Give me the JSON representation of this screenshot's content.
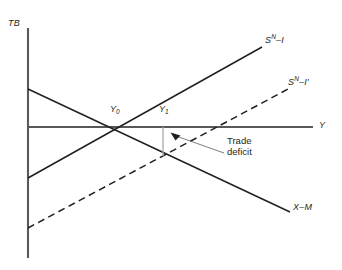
{
  "figure": {
    "type": "economics-line-diagram"
  },
  "axes": {
    "y_axis_label": "TB",
    "x_axis_label": "Y",
    "origin_px": {
      "x": 28,
      "y": 127
    },
    "x_axis_end_px": {
      "x": 313,
      "y": 127
    },
    "y_axis_top_px": {
      "x": 28,
      "y": 28
    },
    "y_axis_bottom_px": {
      "x": 28,
      "y": 258
    }
  },
  "curves": [
    {
      "name": "sn-minus-i",
      "label_base": "S",
      "label_sup": "N",
      "label_rest": "–I",
      "label_text": "Sᴺ–I",
      "style": "solid",
      "color": "#231f20",
      "start_px": {
        "x": 28,
        "y": 178
      },
      "end_px": {
        "x": 262,
        "y": 47
      },
      "label_px": {
        "x": 265,
        "y": 38
      }
    },
    {
      "name": "sn-minus-i-prime",
      "label_base": "S",
      "label_sup": "N",
      "label_rest": "–I′",
      "label_text": "Sᴺ–I′",
      "style": "dashed",
      "color": "#231f20",
      "start_px": {
        "x": 28,
        "y": 228
      },
      "end_px": {
        "x": 290,
        "y": 88
      },
      "label_px": {
        "x": 292,
        "y": 79
      }
    },
    {
      "name": "x-minus-m",
      "label_base": "X",
      "label_sup": "",
      "label_rest": "–M",
      "label_text": "X–M",
      "style": "solid",
      "color": "#231f20",
      "start_px": {
        "x": 28,
        "y": 89
      },
      "end_px": {
        "x": 290,
        "y": 212
      },
      "label_px": {
        "x": 294,
        "y": 206
      }
    }
  ],
  "points": [
    {
      "name": "y0",
      "label_base": "Y",
      "label_sub": "0",
      "label_text": "Y₀",
      "px": {
        "x": 122,
        "y": 127
      },
      "label_px": {
        "x": 111,
        "y": 108
      }
    },
    {
      "name": "y1",
      "label_base": "Y",
      "label_sub": "1",
      "label_text": "Y₁",
      "px": {
        "x": 163,
        "y": 127
      },
      "label_px": {
        "x": 160,
        "y": 108
      }
    }
  ],
  "annotation": {
    "name": "trade-deficit",
    "line1": "Trade",
    "line2": "deficit",
    "text_px": {
      "x": 228,
      "y": 140
    },
    "arrow_tip_px": {
      "x": 171,
      "y": 137
    },
    "leader_start_px": {
      "x": 224,
      "y": 153
    },
    "gap_segment_px": {
      "x": 163,
      "y_top": 127,
      "y_bottom": 156
    }
  },
  "colors": {
    "line": "#231f20",
    "axis": "#58595b",
    "gap_marker": "#a7a9ac",
    "leader": "#6d6e71",
    "background": "#ffffff"
  }
}
